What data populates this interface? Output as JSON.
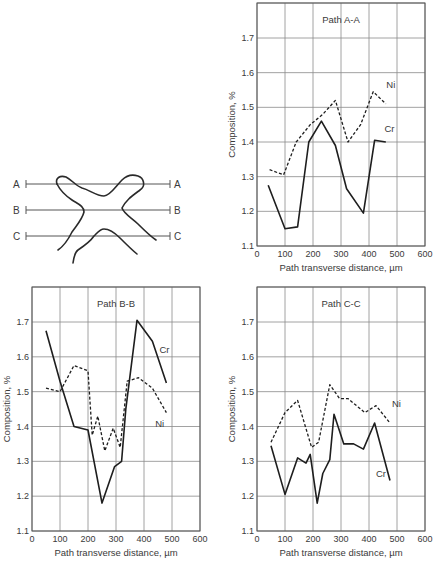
{
  "figure": {
    "diagram": {
      "paths": [
        {
          "left_label": "A",
          "right_label": "A"
        },
        {
          "left_label": "B",
          "right_label": "B"
        },
        {
          "left_label": "C",
          "right_label": "C"
        }
      ]
    }
  },
  "chart_data": [
    {
      "type": "line",
      "title": "Path A-A",
      "xlabel": "Path transverse distance, µm",
      "ylabel": "Composition, %",
      "xlim": [
        0,
        600
      ],
      "ylim": [
        1.1,
        1.8
      ],
      "xticks": [
        0,
        100,
        200,
        300,
        400,
        500,
        600
      ],
      "yticks": [
        1.1,
        1.2,
        1.3,
        1.4,
        1.5,
        1.6,
        1.7
      ],
      "grid": true,
      "series": [
        {
          "name": "Ni",
          "style": "dashed",
          "x": [
            45,
            95,
            140,
            190,
            235,
            280,
            325,
            370,
            415,
            460
          ],
          "y": [
            1.32,
            1.305,
            1.4,
            1.45,
            1.48,
            1.52,
            1.4,
            1.45,
            1.545,
            1.51
          ],
          "label_pos": [
            462,
            1.555
          ]
        },
        {
          "name": "Cr",
          "style": "solid",
          "x": [
            40,
            100,
            145,
            185,
            230,
            280,
            320,
            380,
            420,
            460
          ],
          "y": [
            1.275,
            1.15,
            1.155,
            1.4,
            1.46,
            1.39,
            1.265,
            1.195,
            1.405,
            1.4
          ],
          "label_pos": [
            455,
            1.43
          ]
        }
      ]
    },
    {
      "type": "line",
      "title": "Path B-B",
      "xlabel": "Path transverse distance, µm",
      "ylabel": "Composition, %",
      "xlim": [
        0,
        600
      ],
      "ylim": [
        1.1,
        1.8
      ],
      "xticks": [
        0,
        100,
        200,
        300,
        400,
        500,
        600
      ],
      "yticks": [
        1.1,
        1.2,
        1.3,
        1.4,
        1.5,
        1.6,
        1.7
      ],
      "grid": true,
      "series": [
        {
          "name": "Cr",
          "style": "solid",
          "x": [
            50,
            100,
            150,
            200,
            250,
            295,
            320,
            335,
            375,
            430,
            480
          ],
          "y": [
            1.675,
            1.53,
            1.4,
            1.39,
            1.18,
            1.285,
            1.3,
            1.45,
            1.705,
            1.645,
            1.525
          ],
          "label_pos": [
            455,
            1.61
          ]
        },
        {
          "name": "Ni",
          "style": "dashed",
          "x": [
            50,
            100,
            150,
            200,
            215,
            235,
            260,
            290,
            315,
            340,
            380,
            430,
            480
          ],
          "y": [
            1.51,
            1.5,
            1.575,
            1.56,
            1.375,
            1.43,
            1.33,
            1.395,
            1.34,
            1.53,
            1.54,
            1.51,
            1.44
          ],
          "label_pos": [
            440,
            1.4
          ]
        }
      ]
    },
    {
      "type": "line",
      "title": "Path C-C",
      "xlabel": "Path transverse distance, µm",
      "ylabel": "Composition, %",
      "xlim": [
        0,
        600
      ],
      "ylim": [
        1.1,
        1.8
      ],
      "xticks": [
        0,
        100,
        200,
        300,
        400,
        500,
        600
      ],
      "yticks": [
        1.1,
        1.2,
        1.3,
        1.4,
        1.5,
        1.6,
        1.7
      ],
      "grid": true,
      "series": [
        {
          "name": "Ni",
          "style": "dashed",
          "x": [
            50,
            100,
            145,
            195,
            220,
            260,
            295,
            325,
            385,
            425,
            475
          ],
          "y": [
            1.355,
            1.44,
            1.475,
            1.34,
            1.355,
            1.52,
            1.48,
            1.48,
            1.44,
            1.46,
            1.41
          ],
          "label_pos": [
            482,
            1.455
          ]
        },
        {
          "name": "Cr",
          "style": "solid",
          "x": [
            50,
            100,
            145,
            175,
            190,
            215,
            235,
            260,
            275,
            310,
            345,
            380,
            420,
            475
          ],
          "y": [
            1.345,
            1.205,
            1.31,
            1.295,
            1.32,
            1.18,
            1.265,
            1.305,
            1.435,
            1.35,
            1.35,
            1.335,
            1.41,
            1.245
          ],
          "label_pos": [
            425,
            1.255
          ]
        }
      ]
    }
  ]
}
